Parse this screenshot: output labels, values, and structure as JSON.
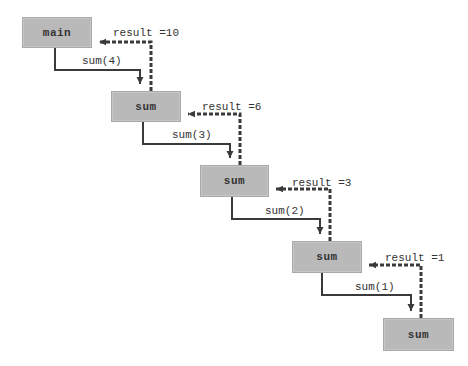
{
  "diagram": {
    "type": "recursive-call-trace",
    "boxes": [
      {
        "label": "main",
        "x": 22,
        "y": 17,
        "w": 70,
        "h": 31
      },
      {
        "label": "sum",
        "x": 111,
        "y": 91,
        "w": 70,
        "h": 31
      },
      {
        "label": "sum",
        "x": 200,
        "y": 165,
        "w": 69,
        "h": 32
      },
      {
        "label": "sum",
        "x": 292,
        "y": 241,
        "w": 70,
        "h": 32
      },
      {
        "label": "sum",
        "x": 383,
        "y": 318,
        "w": 71,
        "h": 33
      }
    ],
    "calls": [
      {
        "label": "sum(4)",
        "x": 82,
        "y": 55
      },
      {
        "label": "sum(3)",
        "x": 172,
        "y": 130
      },
      {
        "label": "sum(2)",
        "x": 265,
        "y": 205
      },
      {
        "label": "sum(1)",
        "x": 355,
        "y": 281
      }
    ],
    "returns": [
      {
        "label": "result =10",
        "x": 113,
        "y": 27
      },
      {
        "label": "result =6",
        "x": 202,
        "y": 101
      },
      {
        "label": "result =3",
        "x": 292,
        "y": 177
      },
      {
        "label": "result =1",
        "x": 385,
        "y": 252
      }
    ],
    "colors": {
      "box_fill": "#b9b9b9",
      "box_border": "#a9a9a9",
      "line": "#3a3a3a",
      "text": "#333333"
    }
  }
}
